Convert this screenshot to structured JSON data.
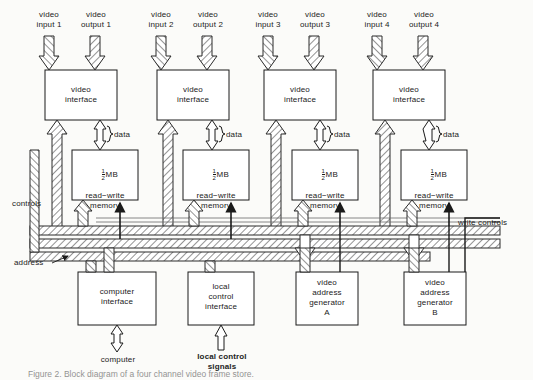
{
  "figure": {
    "type": "block-diagram",
    "background_color": "#fbfbf9",
    "line_color": "#1a1a1a"
  },
  "channels": [
    {
      "id": 1,
      "input_label": "video\ninput 1",
      "output_label": "video\noutput 1",
      "interface_label": "video\ninterface",
      "memory_size": "MB",
      "memory_fraction_num": "1",
      "memory_fraction_den": "2",
      "memory_label": "read−write\nmemory",
      "data_label": "data"
    },
    {
      "id": 2,
      "input_label": "video\ninput 2",
      "output_label": "video\noutput 2",
      "interface_label": "video\ninterface",
      "memory_size": "MB",
      "memory_fraction_num": "1",
      "memory_fraction_den": "2",
      "memory_label": "read−write\nmemory",
      "data_label": "data"
    },
    {
      "id": 3,
      "input_label": "video\ninput 3",
      "output_label": "video\noutput 3",
      "interface_label": "video\ninterface",
      "memory_size": "MB",
      "memory_fraction_num": "1",
      "memory_fraction_den": "2",
      "memory_label": "read−write\nmemory",
      "data_label": "data"
    },
    {
      "id": 4,
      "input_label": "video\ninput 4",
      "output_label": "video\noutput 4",
      "interface_label": "video\ninterface",
      "memory_size": "MB",
      "memory_fraction_num": "1",
      "memory_fraction_den": "2",
      "memory_label": "read−write\nmemory",
      "data_label": "data"
    }
  ],
  "bus_labels": {
    "controls": "controls",
    "address": "address",
    "write_controls": "write controls"
  },
  "bottom_blocks": [
    {
      "id": "computer-interface",
      "label": "computer\ninterface",
      "port_label": "computer",
      "port_bidirectional": true
    },
    {
      "id": "local-control-interface",
      "label": "local\ncontrol\ninterface",
      "port_label": "local control\nsignals",
      "port_bidirectional": false
    },
    {
      "id": "video-address-generator-a",
      "label": "video\naddress\ngenerator\nA",
      "port_label": "",
      "port_bidirectional": false
    },
    {
      "id": "video-address-generator-b",
      "label": "video\naddress\ngenerator\nB",
      "port_label": "",
      "port_bidirectional": false
    }
  ],
  "caption": "Figure 2. Block diagram of a four channel video frame store."
}
